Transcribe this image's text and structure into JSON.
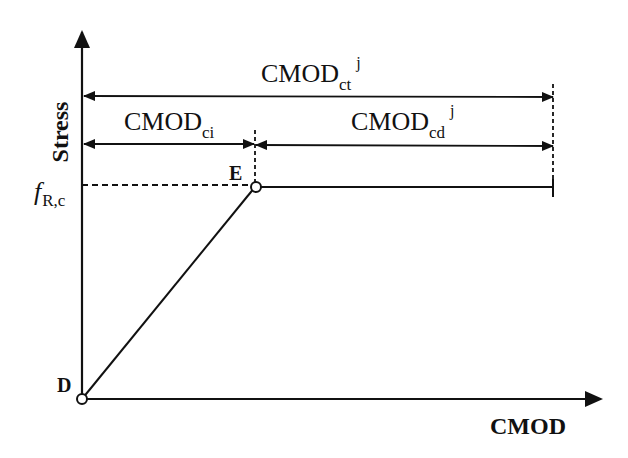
{
  "diagram": {
    "type": "stress-CMOD constitutive model",
    "axes": {
      "y_label": "Stress",
      "x_label": "CMOD"
    },
    "points": {
      "origin": {
        "label": "D"
      },
      "peak": {
        "label": "E"
      }
    },
    "stress_level": {
      "symbol": "f",
      "subscript": "R,c"
    },
    "dimensions": {
      "total": {
        "base": "CMOD",
        "subscript": "ct",
        "superscript": "j"
      },
      "initial": {
        "base": "CMOD",
        "subscript": "ci"
      },
      "delta": {
        "base": "CMOD",
        "subscript": "cd",
        "superscript": "j"
      }
    },
    "colors": {
      "line": "#111111",
      "background": "#ffffff"
    }
  }
}
